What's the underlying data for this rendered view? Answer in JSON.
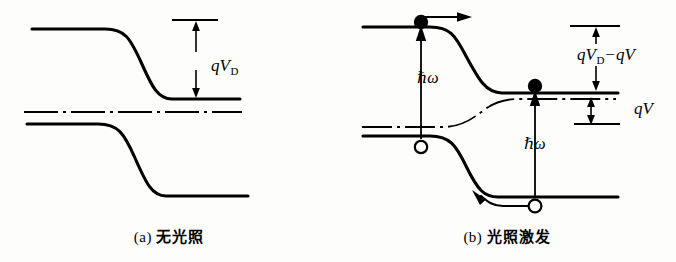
{
  "figure": {
    "type": "semiconductor-band-diagram",
    "stroke_color": "#000000",
    "background_color": "#fdfdfb"
  },
  "panel_a": {
    "caption_index": "(a)",
    "caption_text": "无光照",
    "labels": {
      "barrier": {
        "symbol": "q",
        "variable": "V",
        "subscript": "D"
      }
    },
    "elements": {
      "conduction_band": "conduction-band-curve",
      "valence_band": "valence-band-curve",
      "fermi_level": "fermi-level-dashdot-line",
      "reference_tick": "reference-level-tick",
      "barrier_arrow": "double-headed-barrier-arrow"
    }
  },
  "panel_b": {
    "caption_index": "(b)",
    "caption_text": "光照激发",
    "labels": {
      "barrier_reduced_q": "q",
      "barrier_reduced_v": "V",
      "barrier_reduced_sub": "D",
      "barrier_reduced_op": "−",
      "barrier_reduced_q2": "q",
      "barrier_reduced_v2": "V",
      "photovoltage_q": "q",
      "photovoltage_v": "V",
      "photon_left": "ℏω",
      "photon_right": "ℏω"
    },
    "elements": {
      "conduction_band": "conduction-band-curve",
      "valence_band": "valence-band-curve",
      "quasi_fermi_level": "quasi-fermi-level-dashdot-line",
      "electron_left": "electron-filled-circle",
      "electron_right": "electron-filled-circle",
      "hole_left": "hole-open-circle",
      "hole_right": "hole-open-circle",
      "electron_drift_arrow": "electron-drift-arrow-right",
      "hole_drift_arrow": "hole-drift-arrow-left",
      "photon_arrow_left": "photon-excitation-arrow-up",
      "photon_arrow_right": "photon-excitation-arrow-up",
      "barrier_arrow": "double-headed-barrier-arrow",
      "photovoltage_arrow": "double-headed-photovoltage-arrow",
      "reference_tick": "reference-level-tick",
      "photovoltage_tick": "photovoltage-level-tick"
    }
  }
}
